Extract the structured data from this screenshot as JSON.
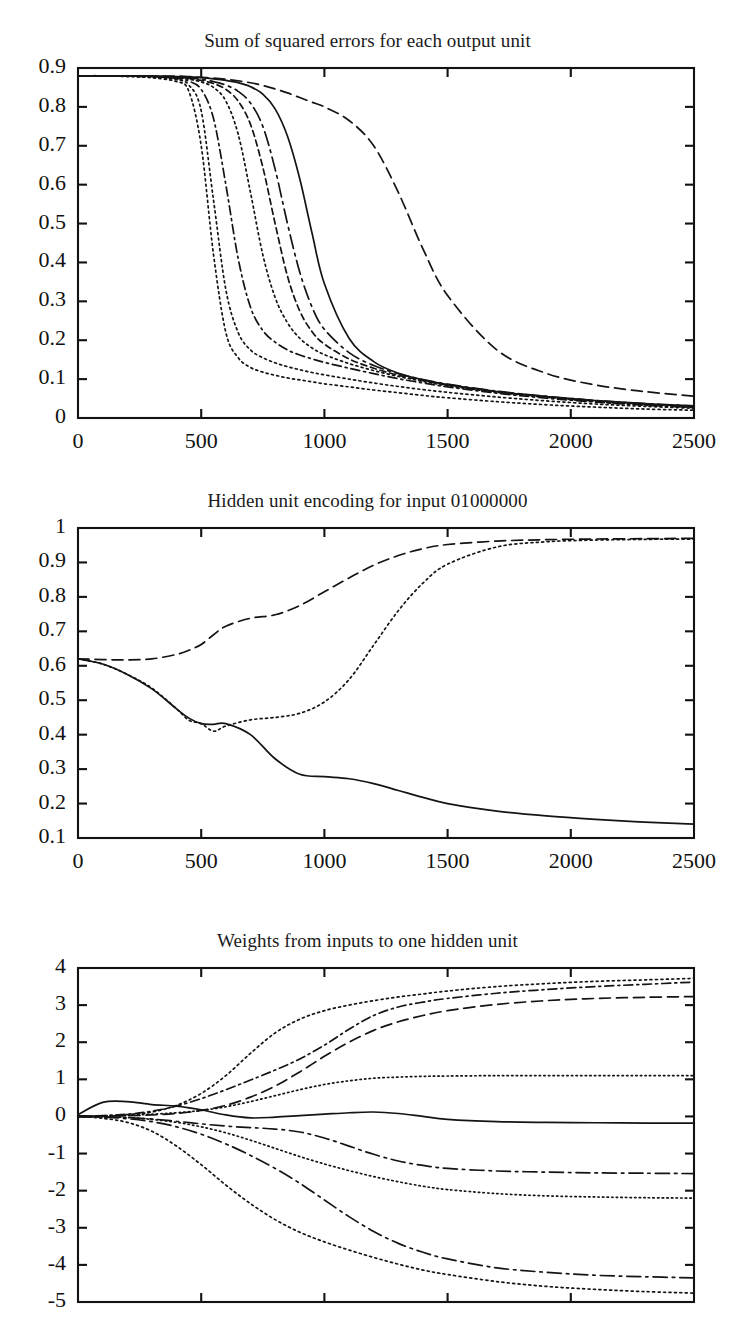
{
  "page": {
    "background": "#ffffff",
    "ink": "#141414",
    "width": 735,
    "height": 1334
  },
  "figures": [
    {
      "id": "figure-1",
      "title": "Sum of squared errors for each output unit"
    },
    {
      "id": "figure-2",
      "title": "Hidden unit encoding for input 01000000"
    },
    {
      "id": "figure-3",
      "title": "Weights from inputs to one hidden unit"
    }
  ],
  "chart_data": [
    {
      "type": "line",
      "title": "Sum of squared errors for each output unit",
      "xlabel": "",
      "ylabel": "",
      "grid": false,
      "legend": "none",
      "xlim": [
        0,
        2500
      ],
      "ylim": [
        0,
        0.9
      ],
      "xticks": [
        0,
        500,
        1000,
        1500,
        2000,
        2500
      ],
      "xticklabels": [
        "0",
        "500",
        "1000",
        "1500",
        "2000",
        "2500"
      ],
      "yticks": [
        0,
        0.1,
        0.2,
        0.3,
        0.4,
        0.5,
        0.6,
        0.7,
        0.8,
        0.9
      ],
      "yticklabels": [
        "0",
        "0.1",
        "0.2",
        "0.3",
        "0.4",
        "0.5",
        "0.6",
        "0.7",
        "0.8",
        "0.9"
      ],
      "x": [
        0,
        100,
        200,
        300,
        400,
        450,
        500,
        550,
        600,
        650,
        700,
        750,
        800,
        850,
        900,
        950,
        1000,
        1100,
        1200,
        1300,
        1400,
        1500,
        1700,
        1900,
        2100,
        2300,
        2500
      ],
      "series": [
        {
          "name": "output-unit-1",
          "style": "dotted",
          "values": [
            0.88,
            0.88,
            0.878,
            0.875,
            0.865,
            0.84,
            0.7,
            0.42,
            0.22,
            0.155,
            0.13,
            0.118,
            0.11,
            0.103,
            0.098,
            0.093,
            0.088,
            0.08,
            0.072,
            0.065,
            0.058,
            0.052,
            0.042,
            0.034,
            0.028,
            0.023,
            0.02
          ]
        },
        {
          "name": "output-unit-2",
          "style": "dotted",
          "values": [
            0.88,
            0.88,
            0.879,
            0.877,
            0.87,
            0.856,
            0.79,
            0.56,
            0.33,
            0.22,
            0.175,
            0.155,
            0.142,
            0.132,
            0.124,
            0.117,
            0.111,
            0.1,
            0.09,
            0.081,
            0.073,
            0.066,
            0.054,
            0.044,
            0.036,
            0.03,
            0.025
          ]
        },
        {
          "name": "output-unit-3",
          "style": "dashdot",
          "values": [
            0.88,
            0.88,
            0.879,
            0.878,
            0.873,
            0.866,
            0.845,
            0.77,
            0.6,
            0.41,
            0.285,
            0.225,
            0.195,
            0.175,
            0.162,
            0.152,
            0.143,
            0.128,
            0.114,
            0.101,
            0.09,
            0.08,
            0.064,
            0.051,
            0.041,
            0.033,
            0.027
          ]
        },
        {
          "name": "output-unit-4",
          "style": "dotted",
          "values": [
            0.88,
            0.88,
            0.879,
            0.878,
            0.875,
            0.871,
            0.864,
            0.85,
            0.815,
            0.73,
            0.58,
            0.42,
            0.31,
            0.245,
            0.205,
            0.18,
            0.163,
            0.14,
            0.122,
            0.107,
            0.094,
            0.083,
            0.066,
            0.053,
            0.042,
            0.034,
            0.028
          ]
        },
        {
          "name": "output-unit-5",
          "style": "dashed-short",
          "values": [
            0.88,
            0.88,
            0.879,
            0.878,
            0.876,
            0.873,
            0.868,
            0.86,
            0.845,
            0.815,
            0.755,
            0.645,
            0.5,
            0.365,
            0.275,
            0.222,
            0.19,
            0.152,
            0.128,
            0.11,
            0.096,
            0.085,
            0.068,
            0.055,
            0.044,
            0.036,
            0.03
          ]
        },
        {
          "name": "output-unit-6",
          "style": "dashdot-long",
          "values": [
            0.88,
            0.88,
            0.879,
            0.879,
            0.877,
            0.875,
            0.871,
            0.865,
            0.856,
            0.84,
            0.81,
            0.75,
            0.64,
            0.5,
            0.375,
            0.285,
            0.228,
            0.168,
            0.135,
            0.114,
            0.099,
            0.087,
            0.069,
            0.056,
            0.045,
            0.037,
            0.031
          ]
        },
        {
          "name": "output-unit-7",
          "style": "solid",
          "values": [
            0.88,
            0.88,
            0.88,
            0.879,
            0.878,
            0.877,
            0.875,
            0.872,
            0.868,
            0.862,
            0.852,
            0.833,
            0.795,
            0.725,
            0.615,
            0.475,
            0.345,
            0.205,
            0.145,
            0.115,
            0.098,
            0.086,
            0.068,
            0.055,
            0.045,
            0.037,
            0.031
          ]
        },
        {
          "name": "output-unit-8",
          "style": "dashed-long",
          "values": [
            0.88,
            0.88,
            0.88,
            0.879,
            0.879,
            0.878,
            0.876,
            0.874,
            0.871,
            0.867,
            0.862,
            0.855,
            0.846,
            0.836,
            0.824,
            0.812,
            0.8,
            0.765,
            0.7,
            0.58,
            0.435,
            0.315,
            0.175,
            0.115,
            0.085,
            0.068,
            0.056
          ]
        }
      ]
    },
    {
      "type": "line",
      "title": "Hidden unit encoding for input 01000000",
      "xlabel": "",
      "ylabel": "",
      "grid": false,
      "legend": "none",
      "xlim": [
        0,
        2500
      ],
      "ylim": [
        0.1,
        1
      ],
      "xticks": [
        0,
        500,
        1000,
        1500,
        2000,
        2500
      ],
      "xticklabels": [
        "0",
        "500",
        "1000",
        "1500",
        "2000",
        "2500"
      ],
      "yticks": [
        0.1,
        0.2,
        0.3,
        0.4,
        0.5,
        0.6,
        0.7,
        0.8,
        0.9,
        1
      ],
      "yticklabels": [
        "0.1",
        "0.2",
        "0.3",
        "0.4",
        "0.5",
        "0.6",
        "0.7",
        "0.8",
        "0.9",
        "1"
      ],
      "x": [
        0,
        100,
        200,
        300,
        400,
        450,
        500,
        550,
        600,
        700,
        800,
        900,
        1000,
        1100,
        1200,
        1300,
        1400,
        1500,
        1700,
        1900,
        2100,
        2300,
        2500
      ],
      "series": [
        {
          "name": "hidden-unit-a",
          "style": "dashed-long",
          "values": [
            0.62,
            0.618,
            0.617,
            0.62,
            0.633,
            0.645,
            0.662,
            0.69,
            0.715,
            0.738,
            0.748,
            0.775,
            0.815,
            0.855,
            0.892,
            0.92,
            0.94,
            0.952,
            0.962,
            0.966,
            0.968,
            0.969,
            0.97
          ]
        },
        {
          "name": "hidden-unit-b",
          "style": "dotted",
          "values": [
            0.62,
            0.605,
            0.575,
            0.535,
            0.475,
            0.442,
            0.432,
            0.41,
            0.425,
            0.443,
            0.45,
            0.462,
            0.495,
            0.56,
            0.66,
            0.76,
            0.84,
            0.895,
            0.945,
            0.96,
            0.965,
            0.967,
            0.968
          ]
        },
        {
          "name": "hidden-unit-c",
          "style": "solid",
          "values": [
            0.62,
            0.605,
            0.575,
            0.533,
            0.475,
            0.448,
            0.432,
            0.43,
            0.432,
            0.4,
            0.33,
            0.285,
            0.278,
            0.272,
            0.258,
            0.238,
            0.218,
            0.2,
            0.178,
            0.164,
            0.154,
            0.146,
            0.14
          ]
        }
      ]
    },
    {
      "type": "line",
      "title": "Weights from inputs to one hidden unit",
      "xlabel": "",
      "ylabel": "",
      "grid": false,
      "legend": "none",
      "xlim": [
        0,
        2500
      ],
      "ylim": [
        -5,
        4
      ],
      "xticks": [
        0,
        500,
        1000,
        1500,
        2000,
        2500
      ],
      "xticklabels": [],
      "yticks": [
        -5,
        -4,
        -3,
        -2,
        -1,
        0,
        1,
        2,
        3,
        4
      ],
      "yticklabels": [
        "-5",
        "-4",
        "-3",
        "-2",
        "-1",
        "0",
        "1",
        "2",
        "3",
        "4"
      ],
      "x": [
        0,
        100,
        200,
        300,
        400,
        500,
        600,
        700,
        800,
        900,
        1000,
        1100,
        1200,
        1300,
        1400,
        1500,
        1700,
        1900,
        2100,
        2300,
        2500
      ],
      "series": [
        {
          "name": "weight-1",
          "style": "dotted",
          "values": [
            0.0,
            0.02,
            0.05,
            0.12,
            0.3,
            0.62,
            1.1,
            1.7,
            2.25,
            2.62,
            2.85,
            3.0,
            3.12,
            3.22,
            3.3,
            3.38,
            3.5,
            3.58,
            3.64,
            3.68,
            3.72
          ]
        },
        {
          "name": "weight-2",
          "style": "dashed-long",
          "values": [
            0.0,
            0.01,
            0.02,
            0.04,
            0.08,
            0.16,
            0.3,
            0.52,
            0.82,
            1.2,
            1.62,
            2.0,
            2.32,
            2.55,
            2.72,
            2.85,
            3.02,
            3.12,
            3.18,
            3.21,
            3.23
          ]
        },
        {
          "name": "weight-3",
          "style": "dashdot",
          "values": [
            0.0,
            0.02,
            0.06,
            0.14,
            0.28,
            0.48,
            0.72,
            0.98,
            1.25,
            1.55,
            1.92,
            2.35,
            2.72,
            2.95,
            3.08,
            3.18,
            3.32,
            3.42,
            3.5,
            3.56,
            3.62
          ]
        },
        {
          "name": "weight-4",
          "style": "dotted-fine",
          "values": [
            0.0,
            0.01,
            0.03,
            0.06,
            0.1,
            0.16,
            0.26,
            0.4,
            0.56,
            0.72,
            0.86,
            0.96,
            1.03,
            1.06,
            1.08,
            1.09,
            1.1,
            1.1,
            1.1,
            1.1,
            1.1
          ]
        },
        {
          "name": "weight-5",
          "style": "solid",
          "values": [
            0.05,
            0.38,
            0.4,
            0.32,
            0.28,
            0.18,
            0.04,
            -0.04,
            -0.02,
            0.02,
            0.06,
            0.1,
            0.12,
            0.08,
            0.0,
            -0.08,
            -0.14,
            -0.16,
            -0.17,
            -0.18,
            -0.18
          ]
        },
        {
          "name": "weight-6",
          "style": "dashdot-long",
          "values": [
            0.0,
            -0.01,
            -0.03,
            -0.07,
            -0.13,
            -0.2,
            -0.26,
            -0.3,
            -0.34,
            -0.42,
            -0.58,
            -0.8,
            -1.02,
            -1.2,
            -1.32,
            -1.4,
            -1.47,
            -1.5,
            -1.52,
            -1.53,
            -1.54
          ]
        },
        {
          "name": "weight-7",
          "style": "dotted-fine",
          "values": [
            0.0,
            -0.01,
            -0.03,
            -0.08,
            -0.16,
            -0.28,
            -0.44,
            -0.64,
            -0.86,
            -1.08,
            -1.28,
            -1.46,
            -1.62,
            -1.76,
            -1.88,
            -1.97,
            -2.08,
            -2.14,
            -2.17,
            -2.19,
            -2.2
          ]
        },
        {
          "name": "weight-8",
          "style": "dashdot-long",
          "values": [
            0.0,
            -0.02,
            -0.06,
            -0.14,
            -0.28,
            -0.48,
            -0.74,
            -1.05,
            -1.4,
            -1.8,
            -2.25,
            -2.7,
            -3.1,
            -3.42,
            -3.66,
            -3.84,
            -4.08,
            -4.2,
            -4.28,
            -4.32,
            -4.35
          ]
        },
        {
          "name": "weight-9",
          "style": "dotted",
          "values": [
            0.0,
            -0.05,
            -0.16,
            -0.4,
            -0.8,
            -1.3,
            -1.85,
            -2.35,
            -2.78,
            -3.12,
            -3.38,
            -3.6,
            -3.8,
            -3.98,
            -4.14,
            -4.26,
            -4.45,
            -4.58,
            -4.66,
            -4.72,
            -4.76
          ]
        }
      ]
    }
  ]
}
